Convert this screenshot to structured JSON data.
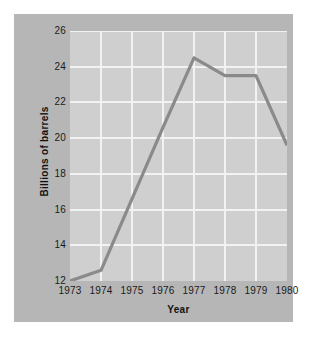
{
  "chart_data": {
    "type": "line",
    "title": "",
    "xlabel": "Year",
    "ylabel": "Billions of barrels",
    "categories": [
      "1973",
      "1974",
      "1975",
      "1976",
      "1977",
      "1978",
      "1979",
      "1980"
    ],
    "values": [
      12.0,
      12.6,
      16.6,
      20.6,
      24.5,
      23.5,
      23.5,
      19.6
    ],
    "series": [
      {
        "name": "Billions of barrels",
        "values": [
          12.0,
          12.6,
          16.6,
          20.6,
          24.5,
          23.5,
          23.5,
          19.6
        ]
      }
    ],
    "x": [
      1973,
      1974,
      1975,
      1976,
      1977,
      1978,
      1979,
      1980
    ],
    "xlim": [
      1973,
      1980
    ],
    "ylim": [
      12,
      26
    ],
    "ytick_labels": [
      "12",
      "14",
      "16",
      "18",
      "20",
      "22",
      "24",
      "26"
    ],
    "ytick_values": [
      12,
      14,
      16,
      18,
      20,
      22,
      24,
      26
    ],
    "xtick_labels": [
      "1973",
      "1974",
      "1975",
      "1976",
      "1977",
      "1978",
      "1979",
      "1980"
    ],
    "grid": true,
    "legend": false,
    "legend_position": "none",
    "annotations": [],
    "colors": {
      "line": "#8a8a8a",
      "plot_background": "#cfcfcf",
      "panel_background": "#b6b6b6",
      "gridline": "#f2f2f2",
      "page_background": "#ffffff",
      "text": "#1a1a1a"
    }
  }
}
